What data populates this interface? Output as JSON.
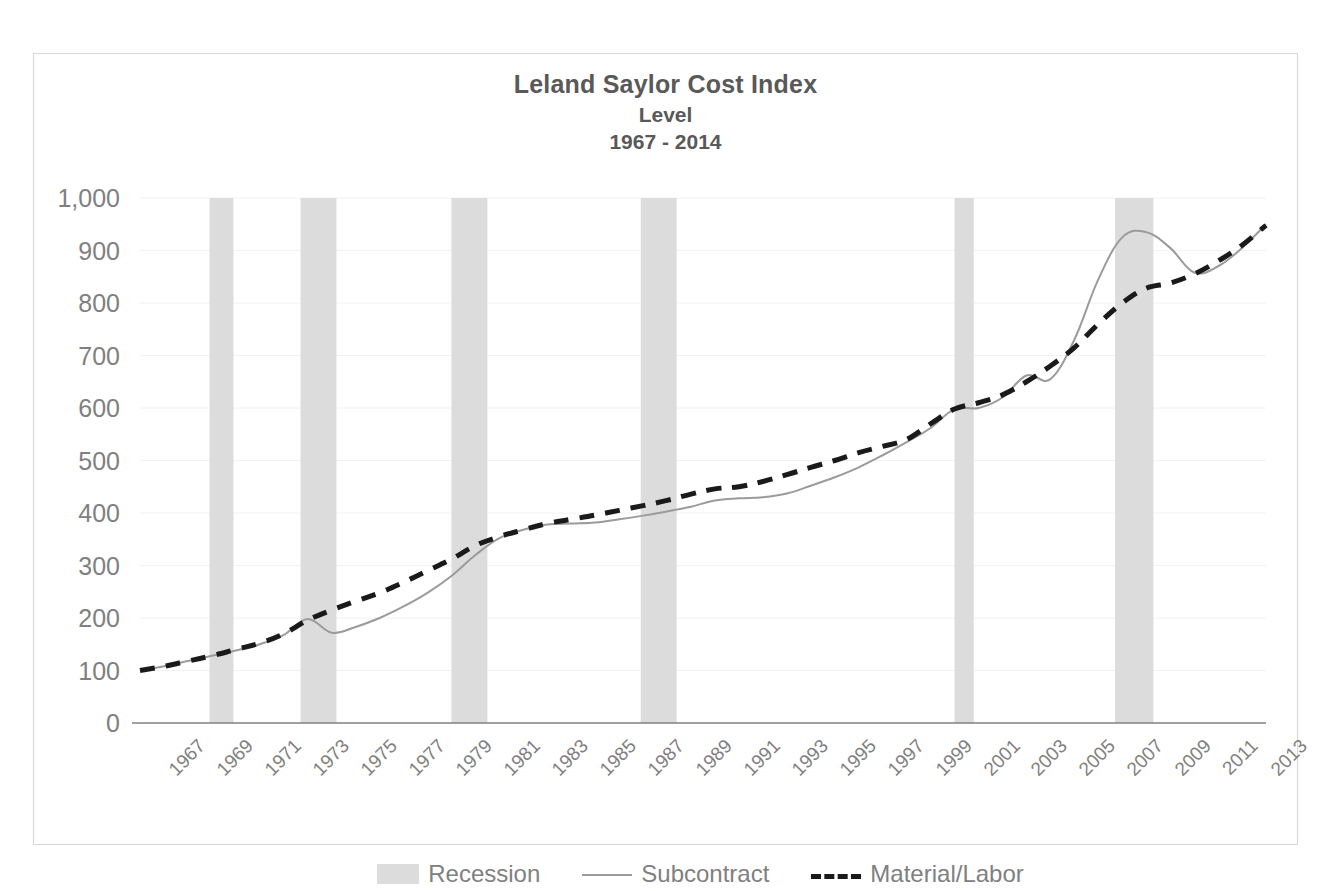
{
  "chart_data": {
    "type": "line",
    "title": "Leland Saylor Cost Index",
    "subtitle": "Level",
    "subtitle2": "1967 - 2014",
    "xlabel": "",
    "ylabel": "",
    "ylim": [
      0,
      1000
    ],
    "ytick_labels": [
      "1,000",
      "900",
      "800",
      "700",
      "600",
      "500",
      "400",
      "300",
      "200",
      "100",
      "0"
    ],
    "ytick_values": [
      1000,
      900,
      800,
      700,
      600,
      500,
      400,
      300,
      200,
      100,
      0
    ],
    "grid": true,
    "legend_position": "bottom",
    "xlim": [
      1967,
      2014
    ],
    "x": [
      1967,
      1968,
      1969,
      1970,
      1971,
      1972,
      1973,
      1974,
      1975,
      1976,
      1977,
      1978,
      1979,
      1980,
      1981,
      1982,
      1983,
      1984,
      1985,
      1986,
      1987,
      1988,
      1989,
      1990,
      1991,
      1992,
      1993,
      1994,
      1995,
      1996,
      1997,
      1998,
      1999,
      2000,
      2001,
      2002,
      2003,
      2004,
      2005,
      2006,
      2007,
      2008,
      2009,
      2010,
      2011,
      2012,
      2013,
      2014
    ],
    "xtick_labels": [
      "1967",
      "1969",
      "1971",
      "1973",
      "1975",
      "1977",
      "1979",
      "1981",
      "1983",
      "1985",
      "1987",
      "1989",
      "1991",
      "1993",
      "1995",
      "1997",
      "1999",
      "2001",
      "2003",
      "2005",
      "2007",
      "2009",
      "2011",
      "2013"
    ],
    "xtick_values": [
      1967,
      1969,
      1971,
      1973,
      1975,
      1977,
      1979,
      1981,
      1983,
      1985,
      1987,
      1989,
      1991,
      1993,
      1995,
      1997,
      1999,
      2001,
      2003,
      2005,
      2007,
      2009,
      2011,
      2013
    ],
    "series": [
      {
        "name": "Subcontract",
        "style": "solid",
        "color": "#9b9b9b",
        "width": 2,
        "values": [
          100,
          108,
          118,
          128,
          138,
          150,
          168,
          198,
          172,
          183,
          200,
          222,
          248,
          280,
          320,
          352,
          368,
          378,
          380,
          382,
          388,
          395,
          403,
          412,
          424,
          428,
          430,
          437,
          452,
          468,
          487,
          510,
          535,
          562,
          598,
          600,
          620,
          662,
          655,
          730,
          845,
          925,
          935,
          905,
          858,
          870,
          905,
          950
        ]
      },
      {
        "name": "Material/Labor",
        "style": "dashed",
        "color": "#1a1a1a",
        "width": 5,
        "values": [
          100,
          108,
          118,
          128,
          140,
          152,
          170,
          196,
          215,
          232,
          248,
          268,
          290,
          312,
          338,
          355,
          368,
          380,
          388,
          396,
          405,
          414,
          424,
          436,
          446,
          450,
          460,
          473,
          487,
          500,
          515,
          527,
          540,
          570,
          598,
          610,
          625,
          650,
          680,
          715,
          760,
          800,
          828,
          838,
          855,
          880,
          910,
          948
        ]
      }
    ],
    "recessions": [
      {
        "start": 1969.9,
        "end": 1970.9
      },
      {
        "start": 1973.7,
        "end": 1975.2
      },
      {
        "start": 1980.0,
        "end": 1981.5
      },
      {
        "start": 1987.9,
        "end": 1989.4
      },
      {
        "start": 2001.0,
        "end": 2001.8
      },
      {
        "start": 2007.7,
        "end": 2009.3
      }
    ],
    "legend": [
      {
        "label": "Recession",
        "marker": "band",
        "color": "#dcdcdc"
      },
      {
        "label": "Subcontract",
        "marker": "line",
        "color": "#9b9b9b"
      },
      {
        "label": "Material/Labor",
        "marker": "dashed-line",
        "color": "#1a1a1a"
      }
    ],
    "colors": {
      "recession_band": "#dcdcdc",
      "subcontract_line": "#9b9b9b",
      "material_labor_line": "#1a1a1a",
      "axis": "#808080",
      "grid": "#f2f2f2",
      "title_text": "#595959",
      "tick_text": "#808080",
      "plot_border": "#d6d6d6"
    }
  }
}
